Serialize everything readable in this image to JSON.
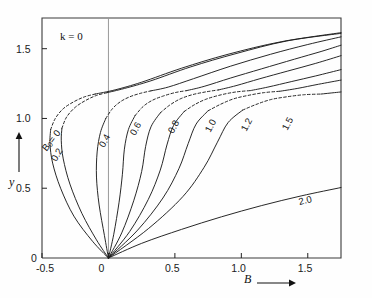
{
  "figure": {
    "parameter_annotation": "k = 0",
    "xlabel": "B",
    "ylabel": "y",
    "x_arrow": "⟶",
    "y_arrow": "↑"
  },
  "axes": {
    "x_ticks": [
      "-0.5",
      "0",
      "0.5",
      "1.0",
      "1.5"
    ],
    "x_tick_values": [
      -0.5,
      0,
      0.5,
      1.0,
      1.5
    ],
    "y_ticks": [
      "0",
      "0.5",
      "1.0",
      "1.5"
    ],
    "y_tick_values": [
      0,
      0.5,
      1.0,
      1.5
    ],
    "xlim": [
      -0.5,
      1.75
    ],
    "ylim": [
      0,
      1.72
    ],
    "zero_line_x": 0
  },
  "series_labels": [
    {
      "text": "B₀= 0",
      "x": 48,
      "y": 142,
      "rot": -52
    },
    {
      "text": "0.2",
      "x": 58,
      "y": 152,
      "rot": -60
    },
    {
      "text": "0.4",
      "x": 106,
      "y": 138,
      "rot": -62
    },
    {
      "text": "0.6",
      "x": 137,
      "y": 126,
      "rot": -62
    },
    {
      "text": "0.8",
      "x": 175,
      "y": 124,
      "rot": -62
    },
    {
      "text": "1.0",
      "x": 212,
      "y": 123,
      "rot": -62
    },
    {
      "text": "1.2",
      "x": 248,
      "y": 122,
      "rot": -62
    },
    {
      "text": "1.5",
      "x": 289,
      "y": 121,
      "rot": -62
    },
    {
      "text": "2.0",
      "x": 300,
      "y": 196,
      "rot": -14
    }
  ],
  "chart_data": {
    "type": "line",
    "title": "",
    "subtitle": "",
    "xlabel": "B",
    "ylabel": "y",
    "xlim": [
      -0.5,
      1.75
    ],
    "ylim": [
      0,
      1.72
    ],
    "grid": false,
    "legend": "inline-curve-labels",
    "annotations": [
      {
        "text": "k = 0",
        "x": 0.07,
        "y": 1.6
      }
    ],
    "note": "Family of S-shaped response curves parameterized by B0; each curve starts at origin (0,0), sweeps left/up, folds back, and rises to the upper right. Solid segments are stable branches; dashed segments are the unstable middle branch.",
    "series": [
      {
        "name": "B₀ = 0",
        "param": 0.0,
        "solid_lower": [
          [
            0,
            0
          ],
          [
            -0.12,
            0.12
          ],
          [
            -0.26,
            0.3
          ],
          [
            -0.36,
            0.5
          ],
          [
            -0.42,
            0.68
          ],
          [
            -0.44,
            0.82
          ],
          [
            -0.435,
            0.92
          ]
        ],
        "dashed_middle": [
          [
            -0.435,
            0.92
          ],
          [
            -0.4,
            1.0
          ],
          [
            -0.34,
            1.07
          ],
          [
            -0.26,
            1.12
          ],
          [
            -0.18,
            1.155
          ],
          [
            -0.1,
            1.175
          ]
        ],
        "solid_upper": [
          [
            -0.1,
            1.175
          ],
          [
            0.05,
            1.205
          ],
          [
            0.25,
            1.26
          ],
          [
            0.55,
            1.36
          ],
          [
            0.9,
            1.46
          ],
          [
            1.3,
            1.55
          ],
          [
            1.75,
            1.615
          ]
        ]
      },
      {
        "name": "0.2",
        "param": 0.2,
        "solid_lower": [
          [
            0,
            0
          ],
          [
            -0.09,
            0.13
          ],
          [
            -0.2,
            0.32
          ],
          [
            -0.29,
            0.53
          ],
          [
            -0.34,
            0.71
          ],
          [
            -0.355,
            0.84
          ],
          [
            -0.35,
            0.93
          ]
        ],
        "dashed_middle": [
          [
            -0.35,
            0.93
          ],
          [
            -0.315,
            1.01
          ],
          [
            -0.25,
            1.08
          ],
          [
            -0.17,
            1.13
          ],
          [
            -0.09,
            1.165
          ],
          [
            -0.01,
            1.185
          ]
        ],
        "solid_upper": [
          [
            -0.01,
            1.185
          ],
          [
            0.12,
            1.215
          ],
          [
            0.32,
            1.27
          ],
          [
            0.62,
            1.37
          ],
          [
            0.96,
            1.465
          ],
          [
            1.34,
            1.555
          ],
          [
            1.75,
            1.61
          ]
        ]
      },
      {
        "name": "0.4",
        "param": 0.4,
        "solid_lower": [
          [
            0,
            0
          ],
          [
            -0.03,
            0.16
          ],
          [
            -0.07,
            0.38
          ],
          [
            -0.09,
            0.58
          ],
          [
            -0.085,
            0.76
          ],
          [
            -0.06,
            0.9
          ],
          [
            -0.02,
            1.0
          ]
        ],
        "dashed_middle": [
          [
            -0.02,
            1.0
          ],
          [
            0.03,
            1.07
          ],
          [
            0.09,
            1.12
          ],
          [
            0.16,
            1.155
          ],
          [
            0.24,
            1.18
          ],
          [
            0.32,
            1.198
          ]
        ],
        "solid_upper": [
          [
            0.32,
            1.198
          ],
          [
            0.45,
            1.225
          ],
          [
            0.64,
            1.285
          ],
          [
            0.92,
            1.375
          ],
          [
            1.22,
            1.46
          ],
          [
            1.5,
            1.53
          ],
          [
            1.75,
            1.585
          ]
        ]
      },
      {
        "name": "0.6",
        "param": 0.6,
        "solid_lower": [
          [
            0,
            0
          ],
          [
            0.04,
            0.17
          ],
          [
            0.08,
            0.4
          ],
          [
            0.105,
            0.6
          ],
          [
            0.12,
            0.78
          ],
          [
            0.15,
            0.92
          ],
          [
            0.2,
            1.02
          ]
        ],
        "dashed_middle": [
          [
            0.2,
            1.02
          ],
          [
            0.26,
            1.085
          ],
          [
            0.33,
            1.13
          ],
          [
            0.41,
            1.16
          ],
          [
            0.5,
            1.185
          ],
          [
            0.59,
            1.2
          ]
        ],
        "solid_upper": [
          [
            0.59,
            1.2
          ],
          [
            0.72,
            1.23
          ],
          [
            0.92,
            1.29
          ],
          [
            1.15,
            1.355
          ],
          [
            1.4,
            1.425
          ],
          [
            1.6,
            1.48
          ],
          [
            1.75,
            1.525
          ]
        ]
      },
      {
        "name": "0.8",
        "param": 0.8,
        "solid_lower": [
          [
            0,
            0
          ],
          [
            0.1,
            0.18
          ],
          [
            0.19,
            0.41
          ],
          [
            0.25,
            0.62
          ],
          [
            0.28,
            0.8
          ],
          [
            0.32,
            0.94
          ],
          [
            0.39,
            1.04
          ]
        ],
        "dashed_middle": [
          [
            0.39,
            1.04
          ],
          [
            0.46,
            1.095
          ],
          [
            0.54,
            1.14
          ],
          [
            0.63,
            1.17
          ],
          [
            0.73,
            1.19
          ],
          [
            0.83,
            1.205
          ]
        ],
        "solid_upper": [
          [
            0.83,
            1.205
          ],
          [
            0.96,
            1.235
          ],
          [
            1.14,
            1.285
          ],
          [
            1.35,
            1.34
          ],
          [
            1.56,
            1.395
          ],
          [
            1.75,
            1.45
          ]
        ]
      },
      {
        "name": "1.0",
        "param": 1.0,
        "solid_lower": [
          [
            0,
            0
          ],
          [
            0.16,
            0.19
          ],
          [
            0.3,
            0.42
          ],
          [
            0.39,
            0.63
          ],
          [
            0.44,
            0.81
          ],
          [
            0.49,
            0.95
          ],
          [
            0.57,
            1.05
          ]
        ],
        "dashed_middle": [
          [
            0.57,
            1.05
          ],
          [
            0.65,
            1.1
          ],
          [
            0.74,
            1.14
          ],
          [
            0.85,
            1.17
          ],
          [
            0.96,
            1.19
          ],
          [
            1.07,
            1.2
          ]
        ],
        "solid_upper": [
          [
            1.07,
            1.2
          ],
          [
            1.2,
            1.225
          ],
          [
            1.38,
            1.265
          ],
          [
            1.56,
            1.305
          ],
          [
            1.75,
            1.35
          ]
        ]
      },
      {
        "name": "1.2",
        "param": 1.2,
        "solid_lower": [
          [
            0,
            0
          ],
          [
            0.22,
            0.2
          ],
          [
            0.41,
            0.43
          ],
          [
            0.53,
            0.64
          ],
          [
            0.6,
            0.82
          ],
          [
            0.66,
            0.96
          ],
          [
            0.75,
            1.055
          ]
        ],
        "dashed_middle": [
          [
            0.75,
            1.055
          ],
          [
            0.84,
            1.1
          ],
          [
            0.94,
            1.14
          ],
          [
            1.05,
            1.165
          ],
          [
            1.17,
            1.185
          ],
          [
            1.29,
            1.195
          ]
        ],
        "solid_upper": [
          [
            1.29,
            1.195
          ],
          [
            1.42,
            1.215
          ],
          [
            1.58,
            1.245
          ],
          [
            1.75,
            1.275
          ]
        ]
      },
      {
        "name": "1.5",
        "param": 1.5,
        "solid_lower": [
          [
            0,
            0
          ],
          [
            0.3,
            0.21
          ],
          [
            0.56,
            0.44
          ],
          [
            0.72,
            0.65
          ],
          [
            0.82,
            0.83
          ],
          [
            0.9,
            0.97
          ],
          [
            1.01,
            1.06
          ]
        ],
        "dashed_middle": [
          [
            1.01,
            1.06
          ],
          [
            1.11,
            1.1
          ],
          [
            1.22,
            1.135
          ],
          [
            1.34,
            1.155
          ],
          [
            1.47,
            1.17
          ],
          [
            1.6,
            1.175
          ]
        ],
        "solid_upper": [
          [
            1.6,
            1.175
          ],
          [
            1.7,
            1.185
          ],
          [
            1.75,
            1.19
          ]
        ]
      },
      {
        "name": "2.0",
        "param": 2.0,
        "solid_lower": [
          [
            0,
            0
          ],
          [
            0.25,
            0.105
          ],
          [
            0.55,
            0.205
          ],
          [
            0.85,
            0.295
          ],
          [
            1.15,
            0.375
          ],
          [
            1.45,
            0.445
          ],
          [
            1.75,
            0.505
          ]
        ],
        "dashed_middle": [],
        "solid_upper": []
      }
    ]
  }
}
